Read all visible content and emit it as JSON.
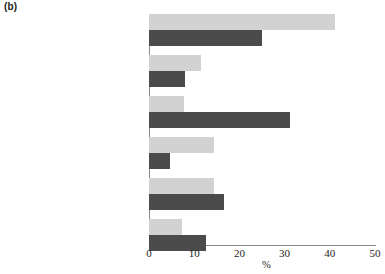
{
  "figure": {
    "panel_label": "(b)"
  },
  "chart_data": {
    "type": "bar",
    "orientation": "horizontal",
    "title": "",
    "xlabel": "%",
    "ylabel": "",
    "xlim": [
      0,
      50
    ],
    "xticks": [
      0,
      10,
      20,
      30,
      40,
      50
    ],
    "xtick_labels": [
      "0",
      "10",
      "20",
      "30",
      "40",
      "50"
    ],
    "grid": false,
    "legend_position": "none",
    "categories": [
      "Cohabiting or married\nwith dependent children",
      "Cohabiting or married\nwith non-dependent children",
      "Cohabiting or married\nwith no children",
      "Female lone parent,\nnon-dependent chldren only",
      "Female lone parent\nwith dependent children",
      "Single female"
    ],
    "series": [
      {
        "name": "light",
        "color": "#d2d2d2",
        "values": [
          41.2,
          11.5,
          7.7,
          14.4,
          14.4,
          7.3
        ]
      },
      {
        "name": "dark",
        "color": "#4b4b4b",
        "values": [
          25.0,
          8.0,
          31.2,
          4.7,
          16.6,
          12.6
        ]
      }
    ]
  },
  "colors": {
    "light_bar": "#d2d2d2",
    "dark_bar": "#4b4b4b",
    "axis": "#8a8a8a",
    "text": "#1c1c1c",
    "background": "#ffffff"
  }
}
